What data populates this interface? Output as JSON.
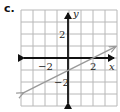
{
  "problem_label": "c.",
  "chart_data": {
    "type": "line",
    "title": "",
    "xlabel": "x",
    "ylabel": "y",
    "xlim": [
      -4,
      4
    ],
    "ylim": [
      -4,
      4
    ],
    "grid": true,
    "x_tick_labels": [
      {
        "value": -2,
        "text": "−2"
      },
      {
        "value": 2,
        "text": "2"
      }
    ],
    "y_tick_labels": [
      {
        "value": 2,
        "text": "2"
      },
      {
        "value": -2,
        "text": "−2"
      }
    ],
    "series": [
      {
        "name": "line",
        "equation": "y = 0.5x - 1",
        "slope": 0.5,
        "intercept": -1,
        "x": [
          -4,
          4
        ],
        "y": [
          -3,
          1
        ],
        "arrows_both_ends": true,
        "color": "#9a9a9a"
      }
    ]
  },
  "colors": {
    "grid": "#b8b8b8",
    "axes": "#111111",
    "line": "#9a9a9a"
  }
}
